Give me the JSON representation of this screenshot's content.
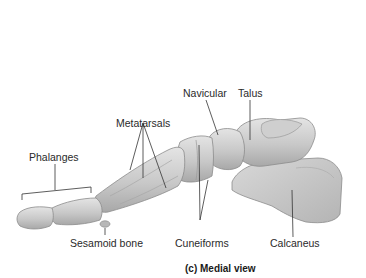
{
  "diagram": {
    "caption": "(c) Medial view",
    "labels": {
      "navicular": "Navicular",
      "talus": "Talus",
      "metatarsals": "Metatarsals",
      "phalanges": "Phalanges",
      "sesamoid": "Sesamoid bone",
      "cuneiforms": "Cuneiforms",
      "calcaneus": "Calcaneus"
    },
    "colors": {
      "bone_fill": "#c9c9c9",
      "bone_light": "#dedede",
      "bone_shadow": "#9a9a9a",
      "leader_line": "#333333",
      "text": "#2a2a2a"
    }
  }
}
